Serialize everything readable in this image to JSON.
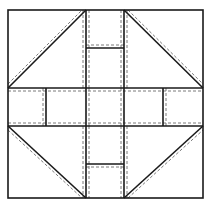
{
  "diagram": {
    "width": 211,
    "height": 209,
    "colors": {
      "background": "#ffffff",
      "solid_line": "#1a1a1a",
      "dashed_line": "#7a7a7a"
    },
    "block": {
      "x1": 8,
      "y1": 10,
      "x2": 203,
      "y2": 198
    },
    "center_strip": {
      "v_left": 86,
      "v_right": 124,
      "h_top": 88,
      "h_bottom": 126
    },
    "strip_dividers": {
      "top_y": 48,
      "bottom_y": 164,
      "left_x": 46,
      "right_x": 163
    },
    "seam_allowance": 3,
    "pieces": [
      {
        "name": "half-square-triangle-top-left",
        "diagonal": "bottom-left-to-top-right"
      },
      {
        "name": "half-square-triangle-top-right",
        "diagonal": "top-left-to-bottom-right"
      },
      {
        "name": "half-square-triangle-bottom-left",
        "diagonal": "top-left-to-bottom-right"
      },
      {
        "name": "half-square-triangle-bottom-right",
        "diagonal": "bottom-left-to-top-right"
      },
      {
        "name": "rail-top-outer"
      },
      {
        "name": "rail-top-inner"
      },
      {
        "name": "rail-bottom-inner"
      },
      {
        "name": "rail-bottom-outer"
      },
      {
        "name": "rail-left-outer"
      },
      {
        "name": "rail-left-inner"
      },
      {
        "name": "rail-right-inner"
      },
      {
        "name": "rail-right-outer"
      },
      {
        "name": "center-square"
      }
    ]
  }
}
